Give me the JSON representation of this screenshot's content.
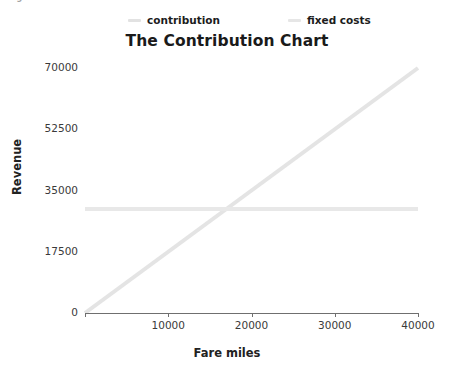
{
  "figure": {
    "caption": "Figure 4.6  The contribution chart"
  },
  "chart_data": {
    "type": "line",
    "title": "The Contribution Chart",
    "xlabel": "Fare miles",
    "ylabel": "Revenue",
    "xlim": [
      0,
      40000
    ],
    "ylim": [
      0,
      70000
    ],
    "grid": false,
    "legend_position": "top",
    "xticks": [
      0,
      10000,
      20000,
      30000,
      40000
    ],
    "xtick_labels": [
      "",
      "10000",
      "20000",
      "30000",
      "40000"
    ],
    "yticks": [
      0,
      17500,
      35000,
      52500,
      70000
    ],
    "ytick_labels": [
      "0",
      "17500",
      "35000",
      "52500",
      "70000"
    ],
    "series": [
      {
        "name": "contribution",
        "color": "#e4e4e4",
        "x": [
          0,
          40000
        ],
        "values": [
          0,
          70000
        ]
      },
      {
        "name": "fixed costs",
        "color": "#e8e8e8",
        "x": [
          0,
          40000
        ],
        "values": [
          29700,
          29700
        ]
      }
    ],
    "annotations": [
      {
        "name": "breakeven-crossing",
        "x": 17000,
        "y": 29700
      }
    ]
  },
  "legend": {
    "entries": [
      {
        "label": "contribution",
        "color": "#e2e2e2"
      },
      {
        "label": "fixed costs",
        "color": "#e6e6e6"
      }
    ]
  },
  "axis_colors": {
    "axis_line": "#6f6f6f",
    "tick_text": "#3a3a3a",
    "title_text": "#1a1a1a"
  }
}
